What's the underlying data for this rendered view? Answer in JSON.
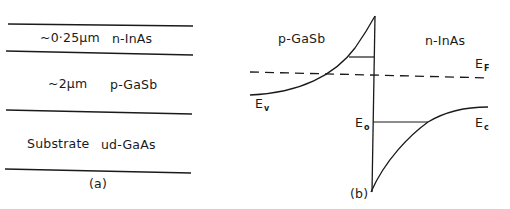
{
  "panel_a": {
    "caption": "(a)",
    "layers": [
      {
        "thickness": "~0·25µm",
        "material": "n-InAs"
      },
      {
        "thickness": "~2µm",
        "material": "p-GaSb"
      },
      {
        "thickness": "Substrate",
        "material": "ud-GaAs"
      }
    ]
  },
  "panel_b": {
    "caption": "(b)",
    "left_region": "p-GaSb",
    "right_region": "n-InAs",
    "labels": {
      "ev_main": "E",
      "ev_sub": "v",
      "ef_main": "E",
      "ef_sub": "F",
      "e0_main": "E",
      "e0_sub": "o",
      "ec_main": "E",
      "ec_sub": "c"
    }
  },
  "colors": {
    "line": "#1a1a1a",
    "background": "#ffffff"
  }
}
